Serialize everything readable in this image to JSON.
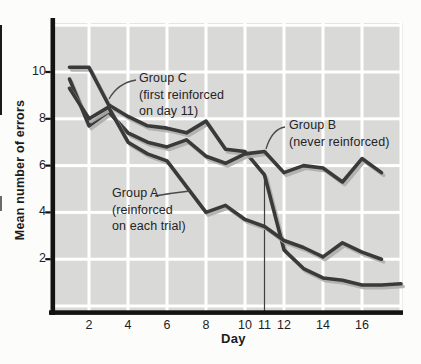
{
  "chart_data": {
    "type": "line",
    "title": "",
    "xlabel": "Day",
    "ylabel": "Mean number of errors",
    "grid": true,
    "xlim": [
      1,
      18
    ],
    "ylim": [
      0,
      12.2
    ],
    "x_tick_values": [
      2,
      4,
      6,
      8,
      10,
      11,
      12,
      14,
      16
    ],
    "x_tick_labels": [
      "2",
      "4",
      "6",
      "8",
      "10",
      "11",
      "12",
      "14",
      "16"
    ],
    "y_tick_values": [
      10,
      8,
      6,
      4,
      2
    ],
    "y_tick_labels": [
      "10",
      "8",
      "6",
      "4",
      "2"
    ],
    "x_days": [
      1,
      2,
      3,
      4,
      5,
      6,
      7,
      8,
      9,
      10,
      11,
      12,
      13,
      14,
      15,
      16,
      17
    ],
    "reference_line_day": 11,
    "series": [
      {
        "name": "Group A",
        "values": [
          9.3,
          8.0,
          8.5,
          7.0,
          6.5,
          6.2,
          5.1,
          4.0,
          4.3,
          3.7,
          3.4,
          2.8,
          2.5,
          2.1,
          2.7,
          2.3,
          2.0
        ]
      },
      {
        "name": "Group B",
        "values": [
          9.7,
          7.7,
          8.3,
          7.4,
          7.0,
          6.8,
          7.1,
          6.4,
          6.1,
          6.5,
          6.6,
          5.7,
          6.0,
          5.9,
          5.3,
          6.3,
          5.7
        ]
      },
      {
        "name": "Group C",
        "values": [
          10.2,
          10.2,
          8.6,
          8.1,
          7.7,
          7.6,
          7.4,
          7.9,
          6.7,
          6.6,
          5.6,
          2.4,
          1.6,
          1.2,
          1.1,
          0.9,
          0.9,
          0.95
        ]
      }
    ],
    "annotations": [
      {
        "id": "group-c",
        "lines": [
          "Group C",
          "(first reinforced",
          "on day 11)"
        ]
      },
      {
        "id": "group-b",
        "lines": [
          "Group B",
          "(never reinforced)"
        ]
      },
      {
        "id": "group-a",
        "lines": [
          "Group A",
          "(reinforced",
          "on each trial)"
        ]
      }
    ]
  },
  "colors": {
    "line": "#3a3a3a",
    "shadow": "#adadad",
    "plot_bg": "#d9d9d8",
    "grid": "#ffffff",
    "axis": "#131313",
    "text": "#242424"
  }
}
